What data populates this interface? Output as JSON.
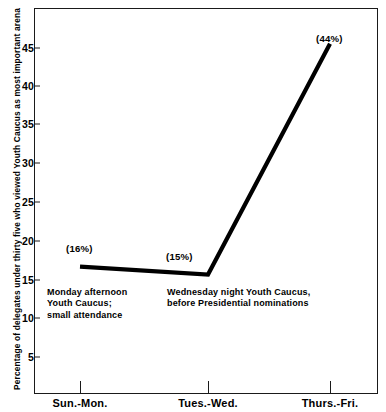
{
  "chart_data": {
    "type": "line",
    "title": "",
    "xlabel": "",
    "ylabel": "Percentage of delegates under thirty five who viewed Youth Caucus as most important arena",
    "categories": [
      "Sun.-Mon.",
      "Tues.-Wed.",
      "Thurs.-Fri."
    ],
    "values": [
      16,
      15,
      44
    ],
    "point_labels": [
      "(16%)",
      "(15%)",
      "(44%)"
    ],
    "yticks": [
      5,
      10,
      15,
      20,
      25,
      30,
      35,
      40,
      45
    ],
    "ytick_labels": [
      "5",
      "10",
      "15",
      "20",
      "25",
      "30",
      "35",
      "40",
      "45"
    ],
    "ylim": [
      0,
      48.5
    ],
    "grid": false,
    "legend": false,
    "line_color": "#000000",
    "annotations": [
      {
        "lines": [
          "Monday afternoon",
          "Youth Caucus;",
          "small attendance"
        ]
      },
      {
        "lines": [
          "Wednesday night  Youth Caucus,",
          "before Presidential nominations"
        ]
      }
    ]
  }
}
